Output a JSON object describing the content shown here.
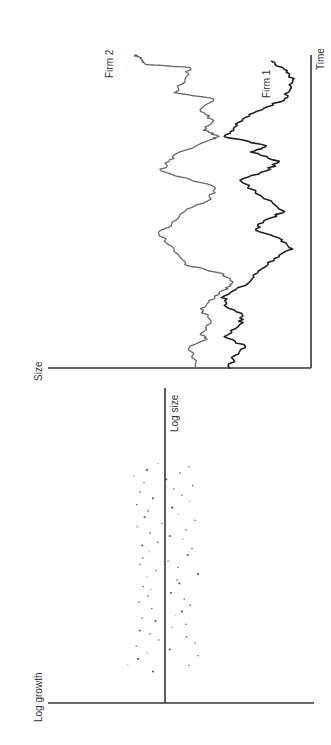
{
  "chart_data": [
    {
      "type": "scatter",
      "panel": "left",
      "orientation": "rotated 90 degrees counter-clockwise",
      "title": "",
      "xlabel": "Log size",
      "ylabel": "Log growth",
      "xlim": [
        0,
        100
      ],
      "ylim": [
        -1,
        1
      ],
      "grid": false,
      "points": [
        {
          "x": 10,
          "y": 0.2
        },
        {
          "x": 12,
          "y": 0.62
        },
        {
          "x": 12,
          "y": -0.4
        },
        {
          "x": 14,
          "y": 0.45
        },
        {
          "x": 15,
          "y": -0.55
        },
        {
          "x": 16,
          "y": 0.3
        },
        {
          "x": 17,
          "y": -0.08
        },
        {
          "x": 18,
          "y": 0.48
        },
        {
          "x": 19,
          "y": -0.5
        },
        {
          "x": 20,
          "y": 0.1
        },
        {
          "x": 21,
          "y": -0.36
        },
        {
          "x": 22,
          "y": 0.25
        },
        {
          "x": 23,
          "y": 0.42
        },
        {
          "x": 24,
          "y": -0.12
        },
        {
          "x": 25,
          "y": -0.35
        },
        {
          "x": 26,
          "y": 0.16
        },
        {
          "x": 27,
          "y": 0.38
        },
        {
          "x": 28,
          "y": -0.18
        },
        {
          "x": 29,
          "y": -0.28
        },
        {
          "x": 30,
          "y": 0.22
        },
        {
          "x": 31,
          "y": -0.42
        },
        {
          "x": 32,
          "y": 0.43
        },
        {
          "x": 33,
          "y": -0.32
        },
        {
          "x": 34,
          "y": 0.28
        },
        {
          "x": 35,
          "y": -0.1
        },
        {
          "x": 36,
          "y": 0.24
        },
        {
          "x": 37,
          "y": 0.36
        },
        {
          "x": 38,
          "y": -0.24
        },
        {
          "x": 39,
          "y": -0.2
        },
        {
          "x": 40,
          "y": 0.3
        },
        {
          "x": 41,
          "y": -0.55
        },
        {
          "x": 42,
          "y": 0.15
        },
        {
          "x": 43,
          "y": -0.22
        },
        {
          "x": 44,
          "y": 0.42
        },
        {
          "x": 45,
          "y": -0.05
        },
        {
          "x": 46,
          "y": 0.37
        },
        {
          "x": 47,
          "y": -0.38
        },
        {
          "x": 48,
          "y": 0.26
        },
        {
          "x": 49,
          "y": -0.45
        },
        {
          "x": 50,
          "y": 0.38
        },
        {
          "x": 51,
          "y": 0.12
        },
        {
          "x": 52,
          "y": -0.3
        },
        {
          "x": 53,
          "y": -0.08
        },
        {
          "x": 54,
          "y": 0.25
        },
        {
          "x": 55,
          "y": -0.35
        },
        {
          "x": 56,
          "y": 0.46
        },
        {
          "x": 57,
          "y": 0.05
        },
        {
          "x": 58,
          "y": -0.5
        },
        {
          "x": 59,
          "y": 0.34
        },
        {
          "x": 60,
          "y": -0.22
        },
        {
          "x": 61,
          "y": 0.28
        },
        {
          "x": 62,
          "y": -0.12
        },
        {
          "x": 63,
          "y": 0.47
        },
        {
          "x": 64,
          "y": -0.41
        },
        {
          "x": 65,
          "y": 0.2
        },
        {
          "x": 66,
          "y": -0.28
        },
        {
          "x": 67,
          "y": 0.42
        },
        {
          "x": 68,
          "y": -0.15
        },
        {
          "x": 69,
          "y": -0.46
        },
        {
          "x": 70,
          "y": 0.35
        },
        {
          "x": 71,
          "y": -0.02
        },
        {
          "x": 72,
          "y": 0.52
        },
        {
          "x": 73,
          "y": -0.25
        },
        {
          "x": 74,
          "y": 0.3
        },
        {
          "x": 75,
          "y": -0.4
        },
        {
          "x": 76,
          "y": 0.12
        }
      ]
    },
    {
      "type": "line",
      "panel": "right",
      "orientation": "rotated 90 degrees counter-clockwise",
      "title": "",
      "xlabel": "Time",
      "ylabel": "Size",
      "xlim": [
        0,
        100
      ],
      "ylim": [
        0,
        100
      ],
      "grid": false,
      "series": [
        {
          "name": "Firm 1",
          "label": "Firm 1",
          "style": "solid-dark",
          "x": [
            0,
            4,
            7,
            10,
            14,
            17,
            20,
            23,
            27,
            31,
            35,
            38,
            41,
            44,
            47,
            50,
            55,
            60,
            63,
            66,
            69,
            71,
            74,
            77,
            80,
            83,
            86,
            89,
            92,
            95,
            98
          ],
          "y": [
            31,
            29,
            25,
            33,
            27,
            26,
            33,
            33,
            24,
            20,
            14,
            7,
            11,
            21,
            18,
            10,
            19,
            27,
            17,
            12,
            23,
            17,
            33,
            29,
            25,
            18,
            10,
            8,
            7,
            9,
            15
          ]
        },
        {
          "name": "Firm 2",
          "label": "Firm 2",
          "style": "dotted-grey",
          "x": [
            0,
            7,
            9,
            11,
            15,
            19,
            22,
            25,
            27,
            30,
            33,
            38,
            43,
            46,
            50,
            54,
            58,
            63,
            66,
            69,
            73,
            74,
            76,
            79,
            82,
            86,
            88,
            92,
            96,
            97,
            99,
            100
          ],
          "y": [
            44,
            46,
            40,
            42,
            38,
            42,
            37,
            33,
            30,
            33,
            48,
            52,
            58,
            53,
            48,
            38,
            37,
            57,
            54,
            50,
            38,
            35,
            41,
            37,
            42,
            37,
            52,
            48,
            46,
            63,
            65,
            67
          ]
        }
      ]
    }
  ],
  "labels": {
    "scatter_x": "Log size",
    "scatter_y": "Log growth",
    "ts_x": "Time",
    "ts_y": "Size",
    "firm1": "Firm 1",
    "firm2": "Firm 2"
  }
}
